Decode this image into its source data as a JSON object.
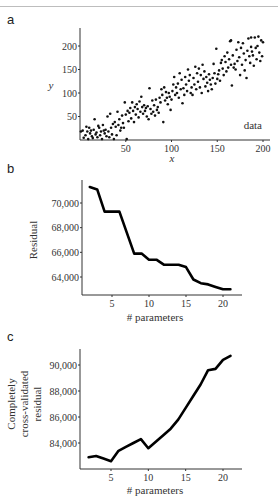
{
  "panels": {
    "a": {
      "letter": "a"
    },
    "b": {
      "letter": "b"
    },
    "c": {
      "letter": "c"
    }
  },
  "chart_data": [
    {
      "id": "a",
      "type": "scatter",
      "title": "",
      "xlabel": "x",
      "ylabel": "y",
      "legend": "data",
      "xlim": [
        0,
        205
      ],
      "ylim": [
        0,
        235
      ],
      "xticks": [
        50,
        100,
        150,
        200
      ],
      "yticks": [
        50,
        100,
        150,
        200
      ],
      "grid": false,
      "note": "Approximately 200 points, roughly y = x + noise (±40)",
      "points": [
        [
          1,
          18
        ],
        [
          3,
          20
        ],
        [
          4,
          5
        ],
        [
          6,
          10
        ],
        [
          7,
          28
        ],
        [
          8,
          18
        ],
        [
          9,
          2
        ],
        [
          10,
          26
        ],
        [
          11,
          14
        ],
        [
          12,
          20
        ],
        [
          13,
          8
        ],
        [
          14,
          4
        ],
        [
          15,
          22
        ],
        [
          16,
          44
        ],
        [
          17,
          12
        ],
        [
          18,
          16
        ],
        [
          19,
          6
        ],
        [
          20,
          30
        ],
        [
          21,
          26
        ],
        [
          22,
          10
        ],
        [
          23,
          18
        ],
        [
          24,
          2
        ],
        [
          25,
          32
        ],
        [
          26,
          20
        ],
        [
          27,
          14
        ],
        [
          28,
          22
        ],
        [
          29,
          8
        ],
        [
          30,
          50
        ],
        [
          31,
          18
        ],
        [
          32,
          6
        ],
        [
          33,
          56
        ],
        [
          34,
          26
        ],
        [
          35,
          12
        ],
        [
          36,
          34
        ],
        [
          37,
          2
        ],
        [
          38,
          38
        ],
        [
          39,
          28
        ],
        [
          40,
          10
        ],
        [
          41,
          60
        ],
        [
          42,
          32
        ],
        [
          43,
          44
        ],
        [
          44,
          20
        ],
        [
          45,
          26
        ],
        [
          46,
          52
        ],
        [
          47,
          36
        ],
        [
          48,
          26
        ],
        [
          49,
          80
        ],
        [
          50,
          54
        ],
        [
          51,
          2
        ],
        [
          52,
          62
        ],
        [
          53,
          40
        ],
        [
          54,
          58
        ],
        [
          55,
          68
        ],
        [
          56,
          46
        ],
        [
          57,
          80
        ],
        [
          58,
          62
        ],
        [
          59,
          38
        ],
        [
          60,
          70
        ],
        [
          61,
          54
        ],
        [
          62,
          76
        ],
        [
          63,
          66
        ],
        [
          64,
          48
        ],
        [
          65,
          82
        ],
        [
          66,
          60
        ],
        [
          67,
          92
        ],
        [
          68,
          70
        ],
        [
          69,
          56
        ],
        [
          70,
          74
        ],
        [
          71,
          62
        ],
        [
          72,
          68
        ],
        [
          73,
          50
        ],
        [
          74,
          72
        ],
        [
          75,
          44
        ],
        [
          76,
          110
        ],
        [
          77,
          66
        ],
        [
          78,
          56
        ],
        [
          79,
          84
        ],
        [
          80,
          60
        ],
        [
          81,
          74
        ],
        [
          82,
          52
        ],
        [
          83,
          86
        ],
        [
          84,
          64
        ],
        [
          85,
          70
        ],
        [
          86,
          58
        ],
        [
          87,
          90
        ],
        [
          88,
          80
        ],
        [
          89,
          108
        ],
        [
          90,
          96
        ],
        [
          91,
          38
        ],
        [
          92,
          112
        ],
        [
          93,
          84
        ],
        [
          94,
          102
        ],
        [
          95,
          90
        ],
        [
          96,
          76
        ],
        [
          97,
          100
        ],
        [
          98,
          92
        ],
        [
          99,
          64
        ],
        [
          100,
          86
        ],
        [
          101,
          104
        ],
        [
          102,
          118
        ],
        [
          103,
          134
        ],
        [
          104,
          96
        ],
        [
          105,
          112
        ],
        [
          106,
          100
        ],
        [
          107,
          120
        ],
        [
          108,
          90
        ],
        [
          109,
          142
        ],
        [
          110,
          108
        ],
        [
          111,
          128
        ],
        [
          112,
          78
        ],
        [
          113,
          110
        ],
        [
          114,
          96
        ],
        [
          115,
          134
        ],
        [
          116,
          118
        ],
        [
          117,
          104
        ],
        [
          118,
          150
        ],
        [
          119,
          126
        ],
        [
          120,
          138
        ],
        [
          121,
          100
        ],
        [
          122,
          112
        ],
        [
          123,
          96
        ],
        [
          124,
          132
        ],
        [
          125,
          118
        ],
        [
          126,
          156
        ],
        [
          127,
          108
        ],
        [
          128,
          142
        ],
        [
          129,
          124
        ],
        [
          130,
          152
        ],
        [
          131,
          112
        ],
        [
          132,
          138
        ],
        [
          133,
          100
        ],
        [
          134,
          160
        ],
        [
          135,
          130
        ],
        [
          136,
          146
        ],
        [
          137,
          114
        ],
        [
          138,
          134
        ],
        [
          139,
          122
        ],
        [
          140,
          104
        ],
        [
          141,
          140
        ],
        [
          142,
          128
        ],
        [
          143,
          118
        ],
        [
          144,
          108
        ],
        [
          145,
          132
        ],
        [
          146,
          162
        ],
        [
          147,
          142
        ],
        [
          148,
          120
        ],
        [
          149,
          194
        ],
        [
          150,
          130
        ],
        [
          151,
          140
        ],
        [
          152,
          148
        ],
        [
          153,
          126
        ],
        [
          154,
          164
        ],
        [
          155,
          170
        ],
        [
          156,
          152
        ],
        [
          157,
          138
        ],
        [
          158,
          178
        ],
        [
          159,
          166
        ],
        [
          160,
          146
        ],
        [
          161,
          186
        ],
        [
          162,
          154
        ],
        [
          163,
          172
        ],
        [
          164,
          210
        ],
        [
          165,
          160
        ],
        [
          166,
          116
        ],
        [
          167,
          180
        ],
        [
          168,
          154
        ],
        [
          169,
          162
        ],
        [
          170,
          150
        ],
        [
          171,
          192
        ],
        [
          172,
          168
        ],
        [
          173,
          208
        ],
        [
          174,
          176
        ],
        [
          175,
          138
        ],
        [
          176,
          196
        ],
        [
          177,
          160
        ],
        [
          178,
          206
        ],
        [
          179,
          184
        ],
        [
          180,
          148
        ],
        [
          181,
          170
        ],
        [
          182,
          132
        ],
        [
          183,
          190
        ],
        [
          184,
          216
        ],
        [
          185,
          178
        ],
        [
          186,
          164
        ],
        [
          187,
          198
        ],
        [
          188,
          188
        ],
        [
          189,
          180
        ],
        [
          190,
          158
        ],
        [
          191,
          218
        ],
        [
          192,
          196
        ],
        [
          193,
          172
        ],
        [
          194,
          200
        ],
        [
          195,
          220
        ],
        [
          196,
          186
        ],
        [
          197,
          168
        ],
        [
          198,
          212
        ],
        [
          199,
          178
        ],
        [
          200,
          208
        ],
        [
          187,
          218
        ],
        [
          165,
          212
        ]
      ]
    },
    {
      "id": "b",
      "type": "line",
      "title": "",
      "xlabel": "# parameters",
      "ylabel": "Residual",
      "xlim": [
        1,
        23
      ],
      "ylim": [
        62700,
        71800
      ],
      "xticks": [
        5,
        10,
        15,
        20
      ],
      "yticks": [
        64000,
        66000,
        68000,
        70000
      ],
      "ytick_labels": [
        "64,000",
        "66,000",
        "68,000",
        "70,000"
      ],
      "grid": false,
      "x": [
        2,
        3,
        4,
        5,
        6,
        7,
        8,
        9,
        10,
        11,
        12,
        13,
        14,
        15,
        16,
        17,
        18,
        19,
        20,
        21
      ],
      "values": [
        71300,
        71100,
        69300,
        69300,
        69300,
        67600,
        65900,
        65900,
        65400,
        65400,
        65000,
        65000,
        65000,
        64800,
        63800,
        63500,
        63400,
        63200,
        63000,
        63000
      ]
    },
    {
      "id": "c",
      "type": "line",
      "title": "",
      "xlabel": "# parameters",
      "ylabel": "Completely cross-validated residual",
      "ylabel_lines": [
        "Completely",
        "cross-validated",
        "residual"
      ],
      "xlim": [
        1,
        23
      ],
      "ylim": [
        82000,
        91200
      ],
      "xticks": [
        5,
        10,
        15,
        20
      ],
      "yticks": [
        84000,
        86000,
        88000,
        90000
      ],
      "ytick_labels": [
        "84,000",
        "86,000",
        "88,000",
        "90,000"
      ],
      "grid": false,
      "x": [
        2,
        3,
        4,
        5,
        6,
        7,
        8,
        9,
        10,
        11,
        12,
        13,
        14,
        15,
        16,
        17,
        18,
        19,
        20,
        21
      ],
      "values": [
        82900,
        83000,
        82800,
        82600,
        83400,
        83700,
        84000,
        84300,
        83600,
        84100,
        84600,
        85100,
        85800,
        86700,
        87600,
        88500,
        89600,
        89700,
        90400,
        90700
      ]
    }
  ]
}
